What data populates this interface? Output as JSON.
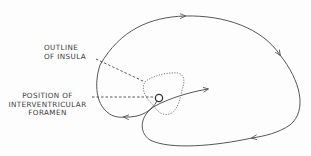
{
  "diagram": {
    "type": "brain-outline-schematic",
    "labels": {
      "insula_line1": "OUTLINE",
      "insula_line2": "OF INSULA",
      "foramen_line1": "POSITION OF",
      "foramen_line2": "INTERVENTRICULAR",
      "foramen_line3": "FORAMEN"
    },
    "colors": {
      "stroke": "#444444",
      "text": "#3a3a3a",
      "background": "#fdfdfd"
    }
  }
}
